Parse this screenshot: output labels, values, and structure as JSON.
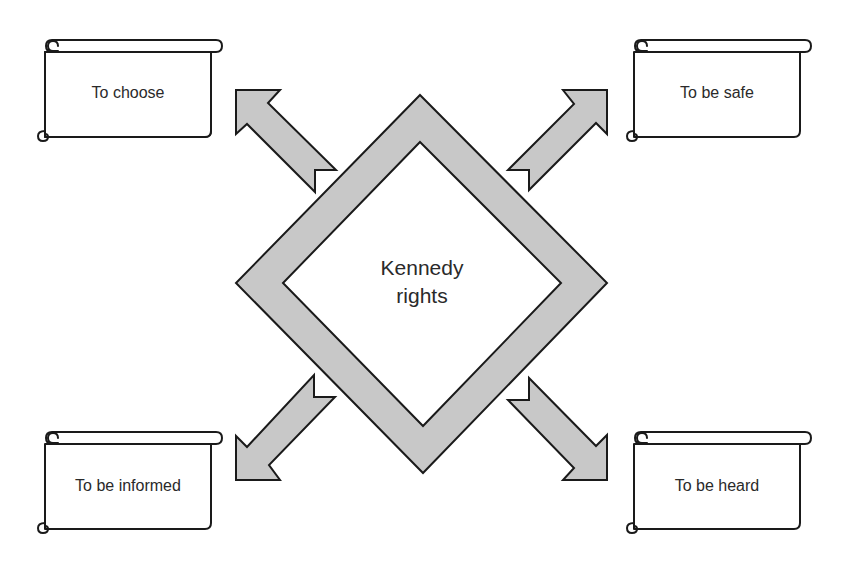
{
  "diagram": {
    "center": {
      "line1": "Kennedy",
      "line2": "rights"
    },
    "rights": [
      {
        "position": "top-left",
        "label": "To choose"
      },
      {
        "position": "top-right",
        "label": "To be safe"
      },
      {
        "position": "bottom-left",
        "label": "To be informed"
      },
      {
        "position": "bottom-right",
        "label": "To be heard"
      }
    ],
    "colors": {
      "arrow_fill": "#c8c8c8",
      "outline": "#1a1a1a",
      "text": "#2a2a2a",
      "background": "#ffffff"
    }
  }
}
